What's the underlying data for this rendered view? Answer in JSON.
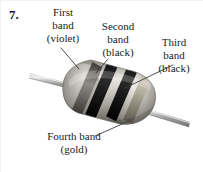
{
  "figure": {
    "item_number": "7.",
    "colors": {
      "body": "#b9b5ad",
      "body_highlight": "#e8e6e1",
      "body_shadow": "#6f6d68",
      "lead_wire": "#9a9a98",
      "lead_wire_highlight": "#dedede",
      "band_violet": "#5d5a58",
      "band_black": "#111111",
      "band_gold": "#a39a88",
      "leader_line": "#4a4a4a",
      "text": "#1a1a1a",
      "background": "#ffffff"
    }
  },
  "callouts": [
    {
      "id": "first",
      "line1": "First",
      "line2": "band",
      "line3": "(violet)"
    },
    {
      "id": "second",
      "line1": "Second",
      "line2": "band",
      "line3": "(black)"
    },
    {
      "id": "third",
      "line1": "Third",
      "line2": "band",
      "line3": "(black)"
    },
    {
      "id": "fourth",
      "line1": "Fourth band",
      "line2": "(gold)",
      "line3": ""
    }
  ]
}
